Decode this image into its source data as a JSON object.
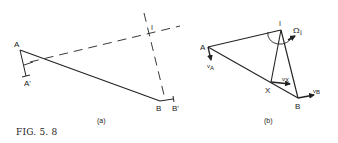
{
  "figure": {
    "caption": "FIG. 5. 8",
    "colors": {
      "line": "#222222",
      "background": "#ffffff"
    }
  },
  "panel_a": {
    "label": "(a)",
    "points": {
      "A": "A",
      "A_prime": "A'",
      "B": "B",
      "B_prime": "B'",
      "I": "I"
    }
  },
  "panel_b": {
    "label": "(b)",
    "points": {
      "A": "A",
      "B": "B",
      "I": "I",
      "X": "X"
    },
    "vectors": {
      "vA": "v",
      "vA_sub": "A",
      "vX": "v",
      "vX_sub": "X",
      "vB": "v",
      "vB_sub": "B"
    },
    "angular_velocity": {
      "symbol": "Ω",
      "sub": "I"
    }
  }
}
